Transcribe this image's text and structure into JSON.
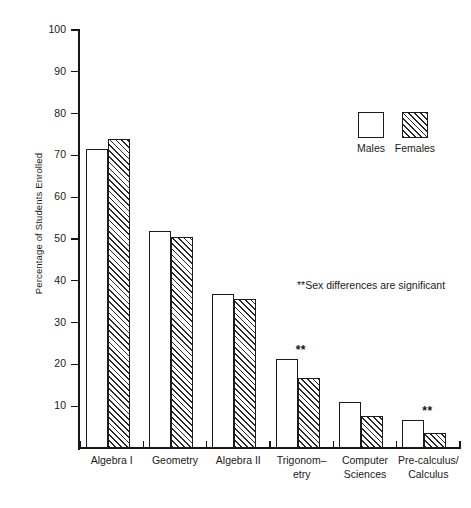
{
  "chart_data": {
    "type": "bar",
    "title": "",
    "xlabel": "",
    "ylabel": "Percentage of Students Enrolled",
    "ylim": [
      0,
      100
    ],
    "ytick_labels": [
      "100",
      "90",
      "80",
      "70",
      "60",
      "50",
      "40",
      "30",
      "20",
      "10"
    ],
    "yticks": [
      100,
      90,
      80,
      70,
      60,
      50,
      40,
      30,
      20,
      10
    ],
    "grid": false,
    "legend_position": "upper right",
    "categories": [
      "Algebra I",
      "Geometry",
      "Algebra II",
      "Trigonom-\netry",
      "Computer\nSciences",
      "Pre-calculus/\nCalculus"
    ],
    "category_lines": [
      [
        "Algebra I"
      ],
      [
        "Geometry"
      ],
      [
        "Algebra II"
      ],
      [
        "Trigonom–",
        "etry"
      ],
      [
        "Computer",
        "Sciences"
      ],
      [
        "Pre-calculus/",
        "Calculus"
      ]
    ],
    "series": [
      {
        "name": "Males",
        "pattern": "solid-white",
        "values": [
          71.5,
          52.0,
          36.8,
          21.2,
          11.0,
          6.8
        ]
      },
      {
        "name": "Females",
        "pattern": "diagonal-hatch",
        "values": [
          74.0,
          50.5,
          35.6,
          16.8,
          7.7,
          3.5
        ]
      }
    ],
    "significance_marker": "**",
    "significant_categories": [
      "Trigonom-etry",
      "Computer Sciences",
      "Pre-calculus/Calculus"
    ],
    "annotations": [
      {
        "text": "**Sex differences are significant"
      }
    ]
  },
  "legend": {
    "items": [
      {
        "label": "Males",
        "pattern": "solid-white"
      },
      {
        "label": "Females",
        "pattern": "diagonal-hatch"
      }
    ]
  },
  "colors": {
    "axis": "#161616",
    "bar_outline": "#1b1b1b",
    "hatch": "#2a2a2a",
    "background": "#ffffff",
    "text": "#1a1a1a"
  }
}
